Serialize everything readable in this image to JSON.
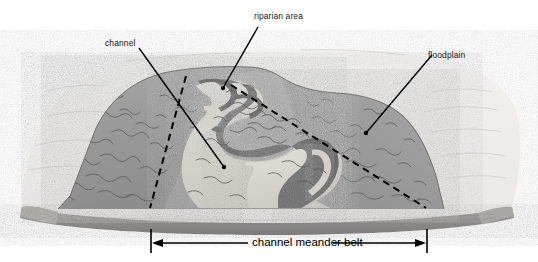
{
  "figure": {
    "type": "block-diagram",
    "background_color": "#ffffff"
  },
  "labels": {
    "channel": "channel",
    "riparian_area": "riparian area",
    "floodplain": "floodplain"
  },
  "caption": {
    "text": "channel meander belt"
  },
  "palette": {
    "page": "#ffffff",
    "block_top_haze": "#f1f1f1",
    "valley_wall": "#9b9b9b",
    "valley_wall_dark": "#8a8a8a",
    "floodplain": "#a3a3a3",
    "water_dark": "#6f6f6f",
    "point_bar_light": "#d8d6cf",
    "riparian_light": "#c9c7c0",
    "block_front_face": "#8f8f8f",
    "block_front_rim": "#e6e4de",
    "line": "#000000"
  },
  "annotations": {
    "dashed_line_left": "meander belt left boundary",
    "dashed_line_right": "meander belt right boundary",
    "dimension_arrow": "double-headed horizontal arrow with end ticks"
  }
}
